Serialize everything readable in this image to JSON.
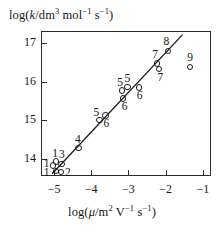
{
  "figure": {
    "name": "kinetics-scatter-plot",
    "ylabel_html": "log(<span class=\"it\">k</span>/dm<sup>3</sup> mol<sup>−1</sup> s<sup>−1</sup>)",
    "xlabel_html": "log(<span class=\"it\">μ</span>/m<sup>2</sup> V<sup>−1</sup> s<sup>−1</sup>)",
    "ylabel_text": "log(k/dm3 mol-1 s-1)",
    "xlabel_text": "log(mu/m2 V-1 s-1)",
    "line_color": "#1c1c1c",
    "marker_color": "#1c1c1c",
    "axis_color": "#2b2b2b"
  },
  "chart_data": {
    "type": "scatter",
    "title": "",
    "xlabel": "log(μ/m² V⁻¹ s⁻¹)",
    "ylabel": "log(k/dm³ mol⁻¹ s⁻¹)",
    "xlim": [
      -5.35,
      -0.78
    ],
    "ylim": [
      13.55,
      17.32
    ],
    "xticks": [
      -5,
      -4,
      -3,
      -2,
      -1
    ],
    "xticklabels": [
      "−5",
      "−4",
      "−3",
      "−2",
      "−1"
    ],
    "yticks": [
      14,
      15,
      16,
      17
    ],
    "yticklabels": [
      "14",
      "15",
      "16",
      "17"
    ],
    "grid": false,
    "legend": false,
    "marker_style": "open-circle",
    "points": [
      {
        "label": "1",
        "x": -4.95,
        "y": 13.93,
        "lx": -4.97,
        "ly": 14.12
      },
      {
        "label": "1",
        "x": -5.02,
        "y": 13.82,
        "lx": -5.2,
        "ly": 13.85
      },
      {
        "label": "1",
        "x": -4.94,
        "y": 13.68,
        "lx": -5.2,
        "ly": 13.64
      },
      {
        "label": "2",
        "x": -4.82,
        "y": 13.66,
        "lx": -4.63,
        "ly": 13.63
      },
      {
        "label": "3",
        "x": -4.8,
        "y": 13.86,
        "lx": -4.79,
        "ly": 14.1
      },
      {
        "label": "4",
        "x": -4.34,
        "y": 14.28,
        "lx": -4.36,
        "ly": 14.49
      },
      {
        "label": "5",
        "x": -3.78,
        "y": 15.0,
        "lx": -3.86,
        "ly": 15.2
      },
      {
        "label": "6",
        "x": -3.62,
        "y": 15.12,
        "lx": -3.59,
        "ly": 14.9
      },
      {
        "label": "5",
        "x": -3.18,
        "y": 15.77,
        "lx": -3.22,
        "ly": 15.97
      },
      {
        "label": "6",
        "x": -3.15,
        "y": 15.57,
        "lx": -3.1,
        "ly": 15.34
      },
      {
        "label": "5",
        "x": -3.02,
        "y": 15.87,
        "lx": -3.03,
        "ly": 16.06
      },
      {
        "label": "6",
        "x": -2.72,
        "y": 15.85,
        "lx": -2.7,
        "ly": 15.62
      },
      {
        "label": "7",
        "x": -2.24,
        "y": 16.48,
        "lx": -2.28,
        "ly": 16.7
      },
      {
        "label": "7",
        "x": -2.18,
        "y": 16.34,
        "lx": -2.14,
        "ly": 16.1
      },
      {
        "label": "8",
        "x": -1.94,
        "y": 16.8,
        "lx": -1.98,
        "ly": 17.03
      },
      {
        "label": "9",
        "x": -1.34,
        "y": 16.39,
        "lx": -1.34,
        "ly": 16.63
      }
    ],
    "fit_line": {
      "x0": -5.05,
      "y0": 13.61,
      "x1": -1.55,
      "y1": 17.22,
      "style": "solid"
    }
  }
}
